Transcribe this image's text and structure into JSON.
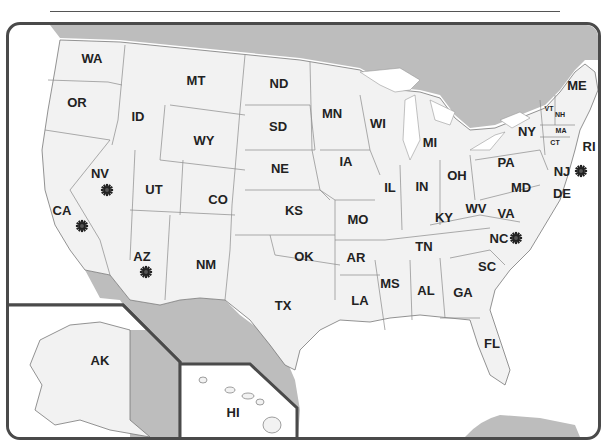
{
  "map": {
    "title": "United States map with state abbreviations",
    "colors": {
      "land": "#f2f2f2",
      "water": "#ffffff",
      "foreign_land": "#bdbdbd",
      "border": "#4a4a4a",
      "marker": "#222222"
    },
    "states": [
      {
        "abbr": "WA",
        "x": 92,
        "y": 58
      },
      {
        "abbr": "OR",
        "x": 77,
        "y": 102
      },
      {
        "abbr": "ID",
        "x": 138,
        "y": 116
      },
      {
        "abbr": "MT",
        "x": 196,
        "y": 80
      },
      {
        "abbr": "ND",
        "x": 279,
        "y": 83
      },
      {
        "abbr": "SD",
        "x": 278,
        "y": 126
      },
      {
        "abbr": "WY",
        "x": 204,
        "y": 140
      },
      {
        "abbr": "NE",
        "x": 280,
        "y": 168
      },
      {
        "abbr": "NV",
        "x": 100,
        "y": 173
      },
      {
        "abbr": "UT",
        "x": 154,
        "y": 189
      },
      {
        "abbr": "CO",
        "x": 218,
        "y": 199
      },
      {
        "abbr": "KS",
        "x": 294,
        "y": 210
      },
      {
        "abbr": "CA",
        "x": 62,
        "y": 210
      },
      {
        "abbr": "AZ",
        "x": 142,
        "y": 256
      },
      {
        "abbr": "NM",
        "x": 206,
        "y": 264
      },
      {
        "abbr": "OK",
        "x": 304,
        "y": 256
      },
      {
        "abbr": "TX",
        "x": 283,
        "y": 305
      },
      {
        "abbr": "MN",
        "x": 332,
        "y": 113
      },
      {
        "abbr": "WI",
        "x": 378,
        "y": 123
      },
      {
        "abbr": "MI",
        "x": 430,
        "y": 142
      },
      {
        "abbr": "IA",
        "x": 346,
        "y": 161
      },
      {
        "abbr": "IL",
        "x": 390,
        "y": 187
      },
      {
        "abbr": "IN",
        "x": 422,
        "y": 186
      },
      {
        "abbr": "OH",
        "x": 457,
        "y": 175
      },
      {
        "abbr": "PA",
        "x": 506,
        "y": 162
      },
      {
        "abbr": "NY",
        "x": 527,
        "y": 131
      },
      {
        "abbr": "ME",
        "x": 577,
        "y": 85
      },
      {
        "abbr": "VT",
        "x": 549,
        "y": 108,
        "small": true
      },
      {
        "abbr": "NH",
        "x": 560,
        "y": 114,
        "small": true
      },
      {
        "abbr": "MA",
        "x": 561,
        "y": 130,
        "small": true
      },
      {
        "abbr": "CT",
        "x": 555,
        "y": 142,
        "small": true
      },
      {
        "abbr": "RI",
        "x": 589,
        "y": 146
      },
      {
        "abbr": "NJ",
        "x": 562,
        "y": 171
      },
      {
        "abbr": "DE",
        "x": 562,
        "y": 193
      },
      {
        "abbr": "MD",
        "x": 521,
        "y": 187
      },
      {
        "abbr": "WV",
        "x": 476,
        "y": 208
      },
      {
        "abbr": "VA",
        "x": 506,
        "y": 213
      },
      {
        "abbr": "KY",
        "x": 444,
        "y": 217
      },
      {
        "abbr": "MO",
        "x": 358,
        "y": 219
      },
      {
        "abbr": "TN",
        "x": 424,
        "y": 246
      },
      {
        "abbr": "NC",
        "x": 499,
        "y": 238
      },
      {
        "abbr": "AR",
        "x": 356,
        "y": 257
      },
      {
        "abbr": "SC",
        "x": 487,
        "y": 266
      },
      {
        "abbr": "MS",
        "x": 390,
        "y": 283
      },
      {
        "abbr": "AL",
        "x": 426,
        "y": 290
      },
      {
        "abbr": "GA",
        "x": 463,
        "y": 292
      },
      {
        "abbr": "LA",
        "x": 360,
        "y": 300
      },
      {
        "abbr": "FL",
        "x": 492,
        "y": 343
      },
      {
        "abbr": "AK",
        "x": 100,
        "y": 360
      },
      {
        "abbr": "HI",
        "x": 233,
        "y": 412
      }
    ],
    "markers": [
      {
        "state": "NV",
        "icon": "sun-marker-icon",
        "x": 107,
        "y": 190
      },
      {
        "state": "CA",
        "icon": "sun-marker-icon",
        "x": 82,
        "y": 226
      },
      {
        "state": "AZ",
        "icon": "sun-marker-icon",
        "x": 146,
        "y": 272
      },
      {
        "state": "NJ",
        "icon": "sun-marker-icon",
        "x": 581,
        "y": 171
      },
      {
        "state": "NC",
        "icon": "sun-marker-icon",
        "x": 516,
        "y": 238
      }
    ]
  }
}
